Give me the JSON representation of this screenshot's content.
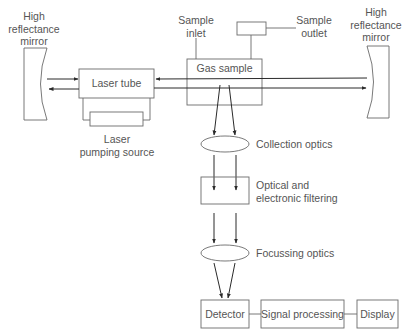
{
  "diagram": {
    "type": "laser Raman spectrometer schematic",
    "colors": {
      "line": "#3a3a3a",
      "box_stroke": "#6a6a6a",
      "text": "#555555",
      "background": "#ffffff"
    },
    "labels": {
      "left_mirror": [
        "High",
        "reflectance",
        "mirror"
      ],
      "right_mirror": [
        "High",
        "reflectance",
        "mirror"
      ],
      "laser_tube": "Laser tube",
      "laser_pumping_source": [
        "Laser",
        "pumping source"
      ],
      "gas_sample": "Gas sample",
      "sample_inlet": [
        "Sample",
        "inlet"
      ],
      "sample_outlet": [
        "Sample",
        "outlet"
      ],
      "collection_optics": "Collection optics",
      "filtering": [
        "Optical and",
        "electronic filtering"
      ],
      "focussing_optics": "Focussing optics",
      "detector": "Detector",
      "signal_processing": "Signal processing",
      "display": "Display"
    },
    "nodes": [
      {
        "id": "left-mirror",
        "kind": "mirror"
      },
      {
        "id": "laser-tube",
        "kind": "box"
      },
      {
        "id": "laser-pumping-source",
        "kind": "box"
      },
      {
        "id": "gas-sample",
        "kind": "box"
      },
      {
        "id": "sample-outlet",
        "kind": "box"
      },
      {
        "id": "right-mirror",
        "kind": "mirror"
      },
      {
        "id": "collection-optics",
        "kind": "lens"
      },
      {
        "id": "filtering",
        "kind": "box"
      },
      {
        "id": "focussing-optics",
        "kind": "lens"
      },
      {
        "id": "detector",
        "kind": "box"
      },
      {
        "id": "signal-processing",
        "kind": "box"
      },
      {
        "id": "display",
        "kind": "box"
      }
    ],
    "edges": [
      {
        "from": "left-mirror",
        "to": "laser-tube",
        "arrow": true
      },
      {
        "from": "gas-sample",
        "to": "laser-tube",
        "arrow": true
      },
      {
        "from": "laser-tube",
        "to": "left-mirror",
        "arrow": true
      },
      {
        "from": "laser-tube",
        "to": "right-mirror",
        "arrow": true
      },
      {
        "from": "laser-tube",
        "to": "laser-pumping-source",
        "arrow": false
      },
      {
        "from": "gas-sample",
        "to": "collection-optics",
        "arrow": true
      },
      {
        "from": "collection-optics",
        "to": "filtering",
        "arrow": true
      },
      {
        "from": "filtering",
        "to": "focussing-optics",
        "arrow": true
      },
      {
        "from": "focussing-optics",
        "to": "detector",
        "arrow": true
      },
      {
        "from": "detector",
        "to": "signal-processing",
        "arrow": false
      },
      {
        "from": "signal-processing",
        "to": "display",
        "arrow": false
      }
    ]
  }
}
